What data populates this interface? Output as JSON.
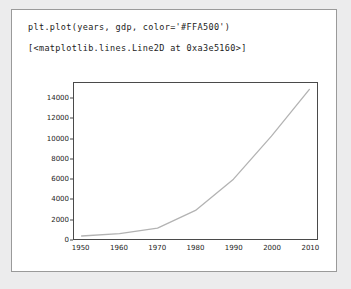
{
  "notebook": {
    "input_code": "plt.plot(years, gdp, color='#FFA500')",
    "output_text": "[<matplotlib.lines.Line2D at 0xa3e5160>]"
  },
  "colors": {
    "accent_in_code": "#FFA500",
    "line_rendered": "#b3b3b3",
    "axis": "#4a4a4a",
    "card_border": "#9a9a9a",
    "page_background": "#ececed"
  },
  "chart_data": {
    "type": "line",
    "title": "",
    "xlabel": "",
    "ylabel": "",
    "xlim": [
      1948,
      2012
    ],
    "ylim": [
      0,
      15600
    ],
    "grid": false,
    "legend": null,
    "xticks": [
      1950,
      1960,
      1970,
      1980,
      1990,
      2000,
      2010
    ],
    "yticks": [
      0,
      2000,
      4000,
      6000,
      8000,
      10000,
      12000,
      14000
    ],
    "series": [
      {
        "name": "gdp",
        "color": "#FFA500",
        "x": [
          1950,
          1960,
          1970,
          1980,
          1990,
          2000,
          2010
        ],
        "values": [
          300,
          540,
          1080,
          2860,
          5980,
          10290,
          14960
        ]
      }
    ]
  }
}
